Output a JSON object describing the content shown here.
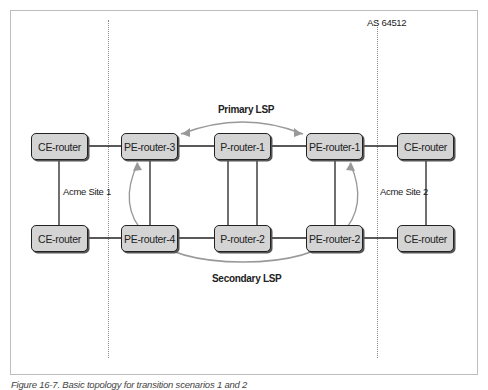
{
  "as_label": "AS 64512",
  "nodes": {
    "ce_left_top": "CE-router",
    "ce_left_bottom": "CE-router",
    "pe3": "PE-router-3",
    "pe4": "PE-router-4",
    "p1": "P-router-1",
    "p2": "P-router-2",
    "pe1": "PE-router-1",
    "pe2": "PE-router-2",
    "ce_right_top": "CE-router",
    "ce_right_bottom": "CE-router"
  },
  "site_labels": {
    "left": "Acme Site 1",
    "right": "Acme Site 2"
  },
  "lsp_labels": {
    "primary": "Primary LSP",
    "secondary": "Secondary LSP"
  },
  "caption": "Figure 16-7. Basic topology for transition scenarios 1 and 2"
}
